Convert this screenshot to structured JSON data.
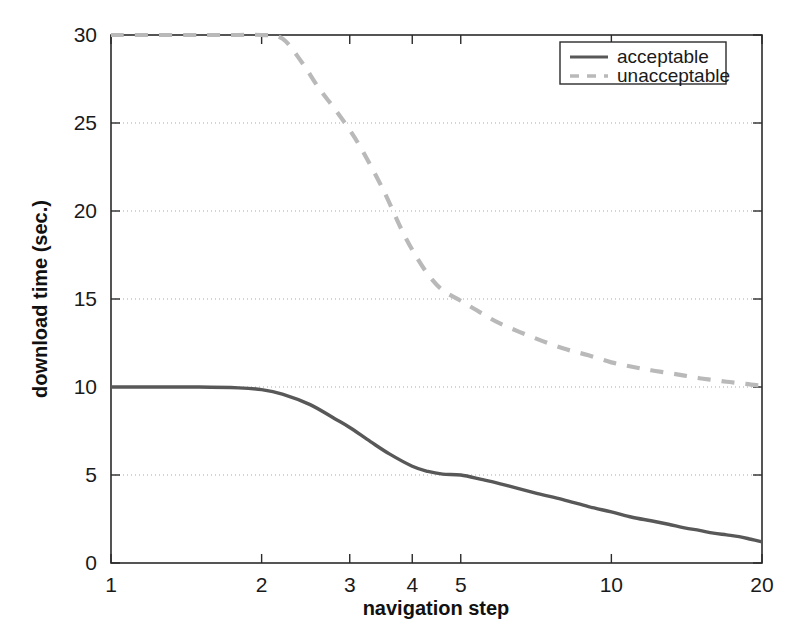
{
  "chart_data": {
    "type": "line",
    "title": "",
    "xlabel": "navigation step",
    "ylabel": "download time (sec.)",
    "xscale": "log",
    "yscale": "linear",
    "xlim": [
      1,
      20
    ],
    "ylim": [
      0,
      30
    ],
    "xticks": [
      1,
      2,
      3,
      4,
      5,
      10,
      20
    ],
    "xticklabels": [
      "1",
      "2",
      "3",
      "4",
      "5",
      "10",
      "20"
    ],
    "yticks": [
      0,
      5,
      10,
      15,
      20,
      25,
      30
    ],
    "yticklabels": [
      "0",
      "5",
      "10",
      "15",
      "20",
      "25",
      "30"
    ],
    "grid": "horizontal-dotted",
    "legend_position": "top-right",
    "series": [
      {
        "name": "acceptable",
        "style": "solid",
        "color": "#585858",
        "x": [
          1,
          1.2,
          1.5,
          1.8,
          2.0,
          2.2,
          2.5,
          2.8,
          3.0,
          3.3,
          3.6,
          4.0,
          4.3,
          4.6,
          5.0,
          5.5,
          6.0,
          7.0,
          8.0,
          9.0,
          10.0,
          11.0,
          12.0,
          13.0,
          14.0,
          15.0,
          16.0,
          17.0,
          18.0,
          19.0,
          20.0
        ],
        "values": [
          10.0,
          10.0,
          10.0,
          9.95,
          9.85,
          9.6,
          9.0,
          8.2,
          7.7,
          6.9,
          6.2,
          5.5,
          5.2,
          5.05,
          5.0,
          4.75,
          4.5,
          4.0,
          3.6,
          3.2,
          2.9,
          2.6,
          2.4,
          2.2,
          2.0,
          1.85,
          1.7,
          1.6,
          1.5,
          1.35,
          1.2
        ]
      },
      {
        "name": "unacceptable",
        "style": "dashed",
        "color": "#b9b9b9",
        "x": [
          1,
          1.5,
          1.8,
          2.0,
          2.2,
          2.4,
          2.6,
          2.8,
          3.0,
          3.2,
          3.5,
          3.8,
          4.0,
          4.3,
          4.6,
          5.0,
          5.5,
          6.0,
          7.0,
          8.0,
          9.0,
          10.0,
          11.0,
          12.0,
          13.0,
          14.0,
          15.0,
          16.0,
          17.0,
          18.0,
          19.0,
          20.0
        ],
        "values": [
          30.0,
          30.0,
          30.0,
          30.0,
          29.8,
          28.5,
          27.0,
          25.8,
          24.6,
          23.3,
          21.2,
          19.0,
          17.8,
          16.4,
          15.5,
          14.9,
          14.2,
          13.6,
          12.8,
          12.2,
          11.8,
          11.4,
          11.15,
          10.95,
          10.8,
          10.65,
          10.5,
          10.4,
          10.3,
          10.22,
          10.14,
          10.08
        ]
      }
    ]
  },
  "legend": {
    "items": [
      {
        "label": "acceptable",
        "style": "solid",
        "color": "#585858"
      },
      {
        "label": "unacceptable",
        "style": "dashed",
        "color": "#b9b9b9"
      }
    ]
  },
  "colors": {
    "acceptable": "#585858",
    "unacceptable": "#b9b9b9",
    "axis": "#2b2b2b",
    "grid": "#aaaaaa",
    "background": "#ffffff"
  }
}
